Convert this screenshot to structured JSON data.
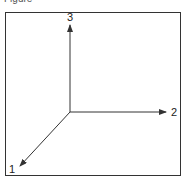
{
  "caption": "Figure",
  "diagram": {
    "type": "3d-coordinate-axes",
    "axes": [
      {
        "id": "1",
        "label": "1",
        "direction": "down-left"
      },
      {
        "id": "2",
        "label": "2",
        "direction": "right"
      },
      {
        "id": "3",
        "label": "3",
        "direction": "up"
      }
    ],
    "colors": {
      "line": "#333333",
      "text": "#222222"
    }
  }
}
